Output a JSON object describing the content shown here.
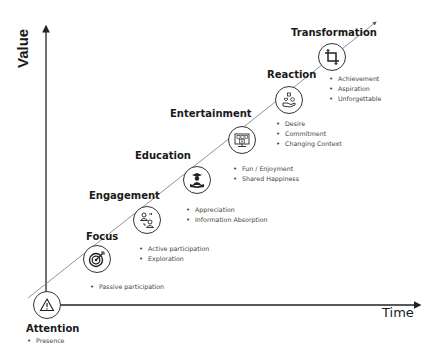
{
  "axes": {
    "y_label": "Value",
    "x_label": "Time"
  },
  "stages": [
    {
      "name": "Attention",
      "icon": "warning-triangle-icon",
      "bullets": [
        "Presence"
      ]
    },
    {
      "name": "Focus",
      "icon": "target-icon",
      "bullets": [
        "Passive participation"
      ]
    },
    {
      "name": "Engagement",
      "icon": "people-exchange-icon",
      "bullets": [
        "Active participation",
        "Exploration"
      ]
    },
    {
      "name": "Education",
      "icon": "graduate-reading-icon",
      "bullets": [
        "Appreciation",
        "Information Absorption"
      ]
    },
    {
      "name": "Entertainment",
      "icon": "media-screen-icon",
      "bullets": [
        "Fun / Enjoyment",
        "Shared Happiness"
      ]
    },
    {
      "name": "Reaction",
      "icon": "hand-giving-icon",
      "bullets": [
        "Desire",
        "Commitment",
        "Changing Context"
      ]
    },
    {
      "name": "Transformation",
      "icon": "crop-icon",
      "bullets": [
        "Achievement",
        "Aspiration",
        "Unforgettable"
      ]
    }
  ],
  "colors": {
    "axis": "#222222",
    "diagonal": "#666666",
    "node_border": "#333333"
  }
}
